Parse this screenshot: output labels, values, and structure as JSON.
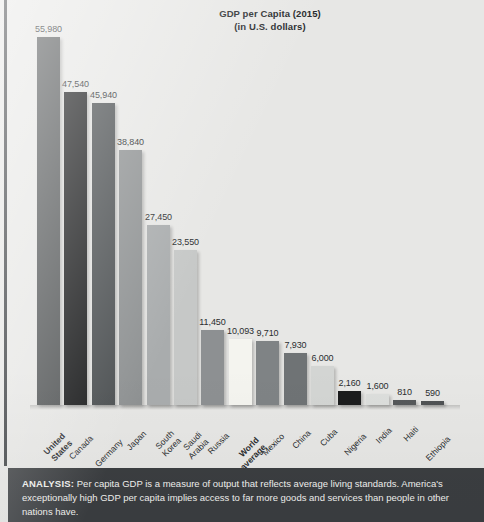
{
  "chart_data": {
    "type": "bar",
    "title": "GDP per Capita (2015)",
    "subtitle": "(in U.S. dollars)",
    "xlabel": "",
    "ylabel": "",
    "ylim": [
      0,
      55980
    ],
    "grid": false,
    "legend": "none",
    "categories": [
      "United States",
      "Canada",
      "Germany",
      "Japan",
      "South Korea",
      "Saudi Arabia",
      "Russia",
      "World average",
      "Mexico",
      "China",
      "Cuba",
      "Nigeria",
      "India",
      "Haiti",
      "Ethiopia"
    ],
    "values": [
      55980,
      47540,
      45940,
      38840,
      27450,
      23550,
      11450,
      10093,
      9710,
      7930,
      6000,
      2160,
      1600,
      810,
      590
    ],
    "value_labels": [
      "55,980",
      "47,540",
      "45,940",
      "38,840",
      "27,450",
      "23,550",
      "11,450",
      "10,093",
      "9,710",
      "7,930",
      "6,000",
      "2,160",
      "1,600",
      "810",
      "590"
    ],
    "bar_colors": [
      "#545758",
      "#1b1c1d",
      "#4c5052",
      "#8f9293",
      "#a9acad",
      "#c6c8c7",
      "#8d9092",
      "#f4f4ef",
      "#7f8385",
      "#6f7375",
      "#d3d5d3",
      "#1b1c1d",
      "#dcdedc",
      "#56595b",
      "#4f5254"
    ],
    "emphasis": [
      true,
      false,
      false,
      false,
      false,
      false,
      false,
      true,
      false,
      false,
      false,
      false,
      false,
      false,
      false
    ]
  },
  "analysis": {
    "label": "ANALYSIS:",
    "body": " Per capita GDP is a measure of output that reflects average living standards. America's exceptionally high GDP per capita implies access to far more goods and services than people in other nations have."
  },
  "colors": {
    "panel_background": "#e7e7e5",
    "analysis_background": "#3b3e41",
    "rule": "#3a3d40",
    "text": "#2a2d2f"
  }
}
